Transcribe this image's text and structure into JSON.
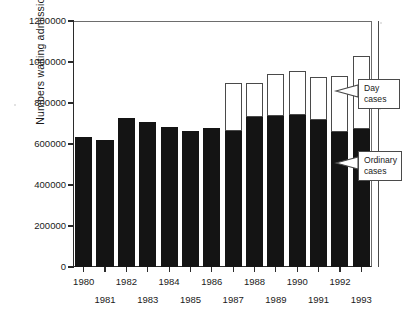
{
  "chart_data": {
    "type": "bar",
    "subtype": "stacked-vertical",
    "title": "",
    "xlabel": "",
    "ylabel": "Numbers waiting admission",
    "categories": [
      "1980",
      "1981",
      "1982",
      "1983",
      "1984",
      "1985",
      "1986",
      "1987",
      "1988",
      "1989",
      "1990",
      "1991",
      "1992",
      "1993"
    ],
    "series": [
      {
        "name": "Ordinary cases",
        "color": "#141414",
        "values": [
          636000,
          620000,
          727000,
          705000,
          682000,
          665000,
          676000,
          663000,
          730000,
          735000,
          742000,
          718000,
          657000,
          672000
        ]
      },
      {
        "name": "Day cases",
        "color": "#ffffff",
        "values": [
          0,
          0,
          0,
          0,
          0,
          0,
          0,
          237000,
          170000,
          205000,
          216000,
          210000,
          275000,
          358000
        ]
      }
    ],
    "totals": [
      636000,
      620000,
      727000,
      705000,
      682000,
      665000,
      676000,
      900000,
      900000,
      940000,
      958000,
      928000,
      932000,
      1030000
    ],
    "ylim": [
      0,
      1200000
    ],
    "yticks": [
      0,
      200000,
      400000,
      600000,
      800000,
      1000000,
      1200000
    ],
    "ytick_labels": [
      "0",
      "200000",
      "400000",
      "600000",
      "800000",
      "1000000",
      "1200000"
    ],
    "grid": false,
    "legend_position": "callouts-right",
    "annotations": [
      {
        "label_line1": "Day",
        "label_line2": "cases",
        "points_to": "white-top-segment"
      },
      {
        "label_line1": "Ordinary",
        "label_line2": "cases",
        "points_to": "black-lower-segment"
      }
    ]
  },
  "axis": {
    "ylabel": "Numbers waiting admission",
    "ytick_labels": [
      "1200000",
      "1000000",
      "800000",
      "600000",
      "400000",
      "200000",
      "0"
    ],
    "xtick_labels_top": [
      "1980",
      "1982",
      "1984",
      "1986",
      "1988",
      "1990",
      "1992"
    ],
    "xtick_labels_bottom": [
      "1981",
      "1983",
      "1985",
      "1987",
      "1989",
      "1991",
      "1993"
    ]
  },
  "callouts": {
    "day": {
      "line1": "Day",
      "line2": "cases"
    },
    "ordinary": {
      "line1": "Ordinary",
      "line2": "cases"
    }
  },
  "colors": {
    "ordinary": "#141414",
    "day": "#ffffff",
    "axis": "#2b2b2b",
    "frame": "#6d6d6d",
    "outline": "#4a4a4a",
    "background": "#ffffff"
  }
}
